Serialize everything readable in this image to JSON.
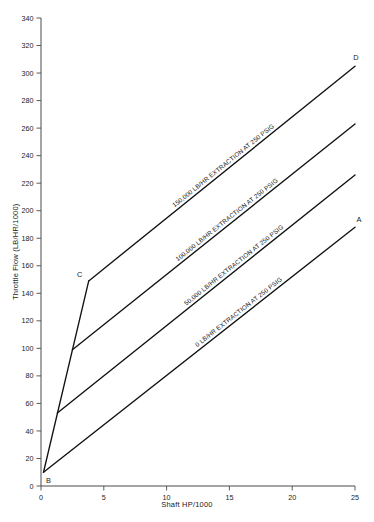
{
  "chart_data": {
    "type": "line",
    "title": "",
    "xlabel": "Shaft HP/1000",
    "ylabel": "Throttle Flow (LB/HR/1000)",
    "xlim": [
      0,
      25
    ],
    "ylim": [
      0,
      340
    ],
    "xticks": [
      0,
      5,
      10,
      15,
      20,
      25
    ],
    "yticks": [
      0,
      20,
      40,
      60,
      80,
      100,
      120,
      140,
      160,
      180,
      200,
      220,
      240,
      260,
      280,
      300,
      320,
      340
    ],
    "grid": false,
    "legend_position": "inline-along-line",
    "series": [
      {
        "name": "0 LB/HR EXTRACTION AT 250 PSIG",
        "label": "0 LB/HR EXTRACTION AT 250 PSIG",
        "x": [
          0.2,
          25
        ],
        "y": [
          10,
          188
        ]
      },
      {
        "name": "50,000 LB/HR EXTRACTION AT 250 PSIG",
        "label": "50,000 LB/HR EXTRACTION AT 250 PSIG",
        "x": [
          1.3,
          25
        ],
        "y": [
          53,
          226
        ]
      },
      {
        "name": "100,000 LB/HR EXTRACTION AT 250 PSIG",
        "label": "100,000 LB/HR EXTRACTION AT 250 PSIG",
        "x": [
          2.5,
          25
        ],
        "y": [
          99,
          263
        ]
      },
      {
        "name": "150,000 LB/HR EXTRACTION AT 250 PSIG",
        "label": "150,000 LB/HR EXTRACTION AT 250 PSIG",
        "x": [
          3.8,
          25
        ],
        "y": [
          149,
          305
        ]
      },
      {
        "name": "B-C minimum throttle limit",
        "label": "",
        "x": [
          0.2,
          3.8
        ],
        "y": [
          10,
          149
        ]
      }
    ],
    "annotations": [
      {
        "text": "A",
        "x": 25,
        "y": 188,
        "position": "above-left"
      },
      {
        "text": "B",
        "x": 0.2,
        "y": 10,
        "position": "below-right"
      },
      {
        "text": "C",
        "x": 3.8,
        "y": 149,
        "position": "above-left"
      },
      {
        "text": "D",
        "x": 25,
        "y": 305,
        "position": "above-left"
      }
    ]
  },
  "axes": {
    "y_title": "Throttle Flow (LB/HR/1000)",
    "x_title": "Shaft HP/1000",
    "y_tick_labels": [
      "0",
      "20",
      "40",
      "60",
      "80",
      "100",
      "120",
      "140",
      "160",
      "180",
      "200",
      "220",
      "240",
      "260",
      "280",
      "300",
      "320",
      "340"
    ],
    "x_tick_labels": [
      "0",
      "5",
      "10",
      "15",
      "20",
      "25"
    ]
  },
  "points": {
    "a": "A",
    "b": "B",
    "c": "C",
    "d": "D"
  },
  "series_labels": {
    "s0": "0 LB/HR EXTRACTION AT 250 PSIG",
    "s50": "50,000 LB/HR EXTRACTION AT 250 PSIG",
    "s100": "100,000 LB/HR EXTRACTION AT 250 PSIG",
    "s150": "150,000 LB/HR EXTRACTION AT 250 PSIG"
  },
  "colors": {
    "line": "#111111",
    "axis": "#4a4a4a",
    "background": "#ffffff",
    "text": "#1a1a1a"
  }
}
